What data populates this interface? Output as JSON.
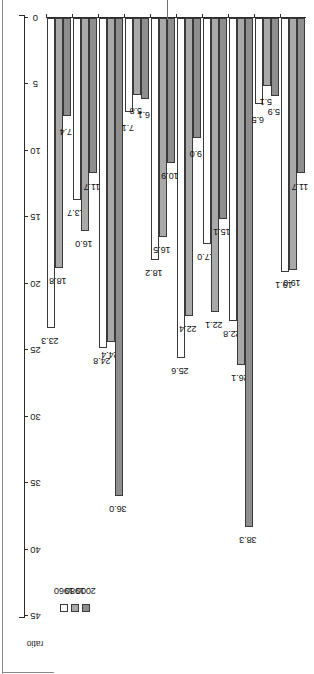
{
  "axis": {
    "unit_label": "ratio",
    "ticks": [
      "0",
      "5",
      "10",
      "15",
      "20",
      "25",
      "30",
      "35",
      "40",
      "45"
    ],
    "min": 0,
    "max": 45
  },
  "legend": {
    "items": [
      {
        "label": "1960",
        "color": "#ffffff"
      },
      {
        "label": "1980",
        "color": "#a9a9a9"
      },
      {
        "label": "2000",
        "color": "#8e8e8e"
      }
    ]
  },
  "panels": [
    {
      "id": "panel-20th",
      "title": "Ratio of US 20th percentile mean income to region's 20th percentile",
      "categories": [
        "East Asia",
        "South Asia",
        "Sub-Saharan\nAfrica",
        "Latin America",
        "Developing\nworld"
      ],
      "series": [
        {
          "name": "1960",
          "values": [
            23.3,
            13.7,
            24.8,
            7.1,
            18.2
          ]
        },
        {
          "name": "1980",
          "values": [
            18.8,
            16.0,
            24.4,
            5.8,
            16.5
          ]
        },
        {
          "name": "2000",
          "values": [
            7.4,
            11.7,
            36.0,
            6.1,
            10.9
          ]
        }
      ],
      "labels": [
        [
          "23.3",
          "18.8",
          "7.4"
        ],
        [
          "13.7",
          "16.0",
          "11.7"
        ],
        [
          "24.8",
          "24.4",
          "36.0"
        ],
        [
          "7.1",
          "5.8",
          "6.1"
        ],
        [
          "18.2",
          "16.5",
          "10.9"
        ]
      ]
    },
    {
      "id": "panel-50th",
      "title": "Ratio of US 50th percentile mean income to region's 50th percentile",
      "categories": [
        "East Asia",
        "South Asia",
        "Sub-Saharan\nAfrica",
        "Latin America",
        "Developing\nworld"
      ],
      "series": [
        {
          "name": "1960",
          "values": [
            25.6,
            17.0,
            22.8,
            6.5,
            19.1
          ]
        },
        {
          "name": "1980",
          "values": [
            22.4,
            22.1,
            26.1,
            5.1,
            19.0
          ]
        },
        {
          "name": "2000",
          "values": [
            9.0,
            15.1,
            38.3,
            5.9,
            11.7
          ]
        }
      ],
      "labels": [
        [
          "25.6",
          "22.4",
          "9.0"
        ],
        [
          "17.0",
          "22.1",
          "15.1"
        ],
        [
          "22.8",
          "26.1",
          "38.3"
        ],
        [
          "6.5",
          "5.1",
          "5.9"
        ],
        [
          "19.1",
          "19.0",
          "11.7"
        ]
      ]
    }
  ],
  "chart_data": {
    "type": "bar",
    "orientation": "horizontal",
    "title": "",
    "xlabel": "ratio",
    "ylabel": "",
    "ylim": [
      0,
      45
    ],
    "grid": false,
    "legend_position": "left",
    "categories": [
      "East Asia",
      "South Asia",
      "Sub-Saharan Africa",
      "Latin America",
      "Developing world"
    ],
    "panels": [
      {
        "title": "Ratio of US 20th percentile mean income to region's 20th percentile",
        "series": [
          {
            "name": "1960",
            "values": [
              23.3,
              13.7,
              24.8,
              7.1,
              18.2
            ]
          },
          {
            "name": "1980",
            "values": [
              18.8,
              16.0,
              24.4,
              5.8,
              16.5
            ]
          },
          {
            "name": "2000",
            "values": [
              7.4,
              11.7,
              36.0,
              6.1,
              10.9
            ]
          }
        ]
      },
      {
        "title": "Ratio of US 50th percentile mean income to region's 50th percentile",
        "series": [
          {
            "name": "1960",
            "values": [
              25.6,
              17.0,
              22.8,
              6.5,
              19.1
            ]
          },
          {
            "name": "1980",
            "values": [
              22.4,
              22.1,
              26.1,
              5.1,
              19.0
            ]
          },
          {
            "name": "2000",
            "values": [
              9.0,
              15.1,
              38.3,
              5.9,
              11.7
            ]
          }
        ]
      }
    ]
  }
}
